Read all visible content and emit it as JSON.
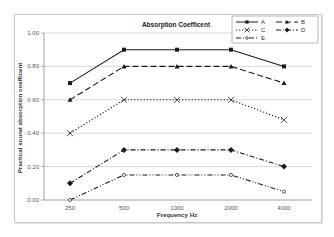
{
  "chart_data": {
    "type": "line",
    "title": "Absorption Coefficent",
    "xlabel": "Frequency Hz",
    "ylabel": "Practical sound absorption coefficent",
    "categories": [
      "250",
      "500",
      "1000",
      "2000",
      "4000"
    ],
    "ylim": [
      0,
      1
    ],
    "yticks": [
      "0.00",
      "0.20",
      "0.40",
      "0.60",
      "0.80",
      "1.00"
    ],
    "grid": true,
    "legend_position": "top-right",
    "series": [
      {
        "name": "A",
        "values": [
          0.7,
          0.9,
          0.9,
          0.9,
          0.8
        ],
        "marker": "square",
        "dash": "solid"
      },
      {
        "name": "B",
        "values": [
          0.6,
          0.8,
          0.8,
          0.8,
          0.7
        ],
        "marker": "triangle",
        "dash": "long-dash"
      },
      {
        "name": "C",
        "values": [
          0.4,
          0.6,
          0.6,
          0.6,
          0.48
        ],
        "marker": "x",
        "dash": "dotted"
      },
      {
        "name": "D",
        "values": [
          0.1,
          0.3,
          0.3,
          0.3,
          0.2
        ],
        "marker": "diamond",
        "dash": "dash-dot"
      },
      {
        "name": "E",
        "values": [
          0.0,
          0.15,
          0.15,
          0.15,
          0.05
        ],
        "marker": "circle-open",
        "dash": "dash-dot-dot"
      }
    ]
  },
  "colors": {
    "line": "#1a1a1a",
    "grid": "#c8c8c8",
    "axis": "#8a8a8a",
    "frame": "#c8c8c8"
  }
}
